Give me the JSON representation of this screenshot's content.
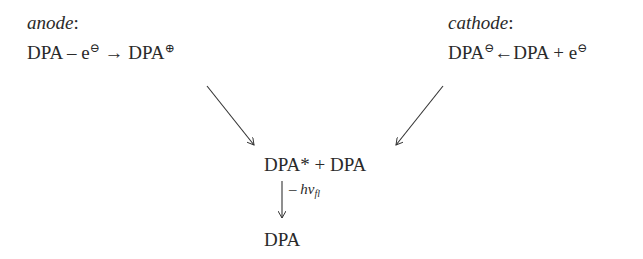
{
  "anode": {
    "label": "anode",
    "colon": ":",
    "reactant": "DPA",
    "op": " – e",
    "electron_charge": "⊖",
    "arrow": " → ",
    "product": "DPA",
    "product_charge": "⊕"
  },
  "cathode": {
    "label": "cathode",
    "colon": ":",
    "product": "DPA",
    "product_charge": "⊖",
    "arrow": "←",
    "reactant": "DPA + e",
    "electron_charge": "⊖"
  },
  "annihilation": {
    "text": "DPA* + DPA"
  },
  "emission": {
    "label_prefix": "– h",
    "nu": "ν",
    "subscript": "fl"
  },
  "ground_state": {
    "text": "DPA"
  }
}
